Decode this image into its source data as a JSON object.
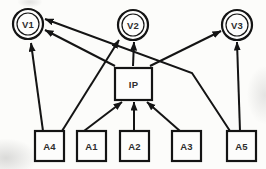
{
  "figure": {
    "kind": "directed-graph-path-diagram",
    "background": "#fcfcfa",
    "line_color": "#141414",
    "node_fill": "#fdfdfc",
    "label_color": "#2e2e2e",
    "label_font_size": 9.5,
    "stroke_width_outer": 2.2,
    "stroke_width_inner": 1.2,
    "edge_stroke_width": 2,
    "nodes": [
      {
        "id": "V1",
        "label": "V1",
        "shape": "double-circle",
        "cx": 28,
        "cy": 24,
        "r": 15
      },
      {
        "id": "V2",
        "label": "V2",
        "shape": "double-circle",
        "cx": 133,
        "cy": 25,
        "r": 15
      },
      {
        "id": "V3",
        "label": "V3",
        "shape": "double-circle",
        "cx": 237,
        "cy": 25,
        "r": 15
      },
      {
        "id": "IP",
        "label": "IP",
        "shape": "rect",
        "x": 115,
        "y": 68,
        "w": 37,
        "h": 32
      },
      {
        "id": "A4",
        "label": "A4",
        "shape": "rect",
        "x": 35,
        "y": 131,
        "w": 29,
        "h": 30
      },
      {
        "id": "A1",
        "label": "A1",
        "shape": "rect",
        "x": 77,
        "y": 131,
        "w": 29,
        "h": 30
      },
      {
        "id": "A2",
        "label": "A2",
        "shape": "rect",
        "x": 120,
        "y": 131,
        "w": 29,
        "h": 30
      },
      {
        "id": "A3",
        "label": "A3",
        "shape": "rect",
        "x": 172,
        "y": 131,
        "w": 29,
        "h": 30
      },
      {
        "id": "A5",
        "label": "A5",
        "shape": "rect",
        "x": 227,
        "y": 131,
        "w": 29,
        "h": 30
      }
    ],
    "edges": [
      {
        "from": "A4",
        "to": "V1",
        "points": [
          [
            43,
            131
          ],
          [
            31,
            43
          ]
        ]
      },
      {
        "from": "A4",
        "to": "V2",
        "points": [
          [
            62,
            131
          ],
          [
            119,
            40
          ]
        ]
      },
      {
        "from": "A1",
        "to": "IP",
        "points": [
          [
            84,
            131
          ],
          [
            122,
            102
          ]
        ]
      },
      {
        "from": "A2",
        "to": "IP",
        "points": [
          [
            134,
            131
          ],
          [
            134,
            102
          ]
        ]
      },
      {
        "from": "A3",
        "to": "IP",
        "points": [
          [
            180,
            131
          ],
          [
            147,
            102
          ]
        ]
      },
      {
        "from": "IP",
        "to": "V2",
        "points": [
          [
            133,
            66
          ],
          [
            134,
            42
          ]
        ]
      },
      {
        "from": "IP",
        "to": "V1",
        "points": [
          [
            115,
            66
          ],
          [
            45,
            30
          ]
        ]
      },
      {
        "from": "IP",
        "to": "V3",
        "points": [
          [
            150,
            66
          ],
          [
            221,
            31
          ]
        ]
      },
      {
        "from": "A5",
        "to": "V3",
        "points": [
          [
            240,
            131
          ],
          [
            237,
            42
          ]
        ]
      },
      {
        "from": "A5",
        "to": "V1",
        "points": [
          [
            230,
            131
          ],
          [
            192,
            73
          ],
          [
            45,
            19
          ]
        ]
      }
    ]
  }
}
